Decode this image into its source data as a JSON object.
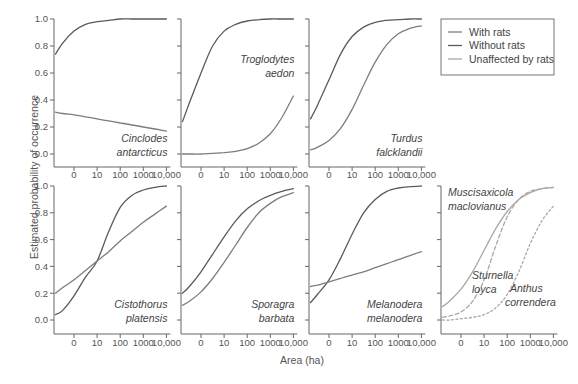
{
  "chart_data": {
    "type": "line",
    "layout": "small multiples, 2 rows x 4 columns",
    "ylabel": "Estimated probability of occurrence",
    "xlabel": "Area (ha)",
    "x_tick_labels": [
      "0",
      "10",
      "100",
      "1000",
      "10,000"
    ],
    "y_tick_labels": [
      "0.0",
      "0.2",
      "0.4",
      "0.6",
      "0.8",
      "1.0"
    ],
    "ylim": [
      0.0,
      1.0
    ],
    "x_scale": "log",
    "grid": false,
    "colors": {
      "with_rats": "#7d7d7d",
      "without_rats": "#5a5a5a",
      "unaffected": "#a8a8a8",
      "axis": "#666666"
    },
    "legend": {
      "position": "top-right (panel 4 slot)",
      "entries": [
        {
          "label": "With rats",
          "key": "with_rats"
        },
        {
          "label": "Without rats",
          "key": "without_rats"
        },
        {
          "label": "Unaffected by rats",
          "key": "unaffected"
        }
      ]
    },
    "x_points": [
      -0.8,
      -0.5,
      0,
      0.5,
      1,
      1.5,
      2,
      2.5,
      3,
      3.5,
      4
    ],
    "panels": [
      {
        "species": [
          "Cinclodes",
          "antarcticus"
        ],
        "label_anchor": "bottom-right",
        "series": [
          {
            "name": "Without rats",
            "key": "without_rats",
            "style": "solid",
            "values": [
              0.74,
              0.82,
              0.91,
              0.96,
              0.98,
              0.99,
              1.0,
              1.0,
              1.0,
              1.0,
              1.0
            ]
          },
          {
            "name": "With rats",
            "key": "with_rats",
            "style": "solid",
            "values": [
              0.31,
              0.3,
              0.29,
              0.275,
              0.26,
              0.245,
              0.23,
              0.215,
              0.2,
              0.185,
              0.17
            ]
          }
        ]
      },
      {
        "species": [
          "Troglodytes",
          "aedon"
        ],
        "label_anchor": "middle-right",
        "series": [
          {
            "name": "Without rats",
            "key": "without_rats",
            "style": "solid",
            "values": [
              0.24,
              0.38,
              0.6,
              0.8,
              0.91,
              0.96,
              0.985,
              0.995,
              1.0,
              1.0,
              1.0
            ]
          },
          {
            "name": "With rats",
            "key": "with_rats",
            "style": "solid",
            "values": [
              0.0,
              0.0,
              0.0,
              0.005,
              0.01,
              0.02,
              0.04,
              0.08,
              0.15,
              0.27,
              0.43
            ]
          }
        ]
      },
      {
        "species": [
          "Turdus",
          "falcklandii"
        ],
        "label_anchor": "bottom-right",
        "series": [
          {
            "name": "Without rats",
            "key": "without_rats",
            "style": "solid",
            "values": [
              0.26,
              0.36,
              0.55,
              0.74,
              0.87,
              0.94,
              0.975,
              0.99,
              0.995,
              1.0,
              1.0
            ]
          },
          {
            "name": "With rats",
            "key": "with_rats",
            "style": "solid",
            "values": [
              0.03,
              0.05,
              0.1,
              0.19,
              0.33,
              0.51,
              0.68,
              0.81,
              0.89,
              0.93,
              0.95
            ]
          }
        ]
      },
      {
        "species": [
          "Cistothorus",
          "platensis"
        ],
        "label_anchor": "bottom-right",
        "series": [
          {
            "name": "Without rats",
            "key": "without_rats",
            "style": "solid",
            "values": [
              0.04,
              0.07,
              0.18,
              0.32,
              0.44,
              0.66,
              0.84,
              0.93,
              0.97,
              0.99,
              1.0
            ]
          },
          {
            "name": "With rats",
            "key": "with_rats",
            "style": "solid",
            "values": [
              0.2,
              0.24,
              0.3,
              0.37,
              0.44,
              0.51,
              0.59,
              0.66,
              0.73,
              0.79,
              0.85
            ]
          }
        ]
      },
      {
        "species": [
          "Sporagra",
          "barbata"
        ],
        "label_anchor": "bottom-right",
        "series": [
          {
            "name": "Without rats",
            "key": "without_rats",
            "style": "solid",
            "values": [
              0.2,
              0.25,
              0.36,
              0.49,
              0.62,
              0.74,
              0.83,
              0.89,
              0.93,
              0.96,
              0.98
            ]
          },
          {
            "name": "With rats",
            "key": "with_rats",
            "style": "solid",
            "values": [
              0.11,
              0.14,
              0.21,
              0.31,
              0.43,
              0.56,
              0.69,
              0.8,
              0.87,
              0.92,
              0.95
            ]
          }
        ]
      },
      {
        "species": [
          "Melanodera",
          "melanodera"
        ],
        "label_anchor": "bottom-right",
        "series": [
          {
            "name": "Without rats",
            "key": "without_rats",
            "style": "solid",
            "values": [
              0.13,
              0.19,
              0.3,
              0.46,
              0.64,
              0.8,
              0.9,
              0.96,
              0.985,
              0.995,
              1.0
            ]
          },
          {
            "name": "With rats",
            "key": "with_rats",
            "style": "solid",
            "values": [
              0.25,
              0.26,
              0.285,
              0.31,
              0.335,
              0.36,
              0.39,
              0.42,
              0.45,
              0.48,
              0.51
            ]
          }
        ]
      },
      {
        "species_labels": [
          {
            "text": [
              "Muscisaxicola",
              "maclovianus"
            ],
            "position": "top-left"
          },
          {
            "text": [
              "Sturnella",
              "loyca"
            ],
            "position": "center"
          },
          {
            "text": [
              "Anthus",
              "correndera"
            ],
            "position": "bottom-right"
          }
        ],
        "series": [
          {
            "name": "Muscisaxicola maclovianus",
            "key": "unaffected",
            "style": "solid",
            "values": [
              0.1,
              0.14,
              0.23,
              0.36,
              0.52,
              0.68,
              0.81,
              0.9,
              0.95,
              0.98,
              0.99
            ]
          },
          {
            "name": "Sturnella loyca",
            "key": "unaffected",
            "style": "dashed",
            "values": [
              0.02,
              0.03,
              0.06,
              0.14,
              0.3,
              0.55,
              0.77,
              0.9,
              0.96,
              0.98,
              0.99
            ]
          },
          {
            "name": "Anthus correndera",
            "key": "unaffected",
            "style": "dotted",
            "values": [
              0.0,
              0.0,
              0.01,
              0.02,
              0.04,
              0.09,
              0.19,
              0.36,
              0.57,
              0.74,
              0.85
            ]
          }
        ]
      }
    ]
  }
}
